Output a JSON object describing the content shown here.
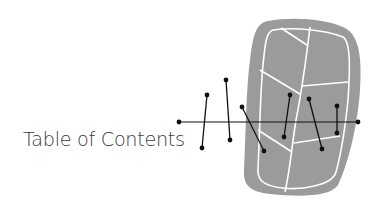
{
  "title": "Table of Contents",
  "colors": {
    "background": "#ffffff",
    "blob_fill": "#9b9b9b",
    "blob_lines": "#ffffff",
    "ink": "#111111",
    "text": "#3a3a3a"
  },
  "graphic": {
    "description": "decorative gray leaf/stone shape with white vein lines, crossed by a horizontal line and six short pin segments with dot ends"
  }
}
